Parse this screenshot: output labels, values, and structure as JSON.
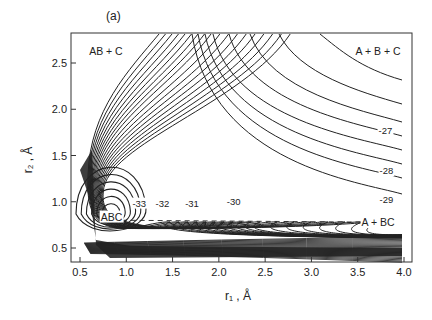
{
  "figure": {
    "panel_label": "(a)",
    "background": "#ffffff",
    "ink": "#222222"
  },
  "chart_data": {
    "type": "contour",
    "title": "",
    "panel_label": "(a)",
    "xlabel": "r₁ , Å",
    "ylabel": "r₂ , Å",
    "xlim": [
      0.4,
      4.05
    ],
    "ylim": [
      0.35,
      2.8
    ],
    "grid": false,
    "x_ticks": [
      0.5,
      1.0,
      1.5,
      2.0,
      2.5,
      3.0,
      3.5,
      4.0
    ],
    "x_tick_labels": [
      "0.5",
      "1.0",
      "1.5",
      "2.0",
      "2.5",
      "3.0",
      "3.5",
      "4.0"
    ],
    "y_ticks": [
      0.5,
      1.0,
      1.5,
      2.0,
      2.5
    ],
    "y_tick_labels": [
      "0.5",
      "1.0",
      "1.5",
      "2.0",
      "2.5"
    ],
    "region_labels": [
      {
        "text": "AB + C",
        "x": 0.78,
        "y": 2.63
      },
      {
        "text": "A + B + C",
        "x": 3.72,
        "y": 2.63
      },
      {
        "text": "ABC",
        "x": 0.84,
        "y": 0.84
      },
      {
        "text": "A + BC",
        "x": 3.72,
        "y": 0.78
      }
    ],
    "contour_labels": [
      {
        "text": "-33",
        "x": 1.14,
        "y": 0.98
      },
      {
        "text": "-32",
        "x": 1.39,
        "y": 0.98
      },
      {
        "text": "-31",
        "x": 1.71,
        "y": 0.98
      },
      {
        "text": "-30",
        "x": 2.16,
        "y": 1.0
      },
      {
        "text": "-29",
        "x": 3.81,
        "y": 1.02
      },
      {
        "text": "-28",
        "x": 3.81,
        "y": 1.33
      },
      {
        "text": "-27",
        "x": 3.8,
        "y": 1.76
      }
    ],
    "minimum": {
      "label": "ABC",
      "r1": 0.84,
      "r2": 0.84
    },
    "reaction_path": {
      "style": "dashed",
      "from": [
        0.95,
        0.8
      ],
      "to": [
        3.55,
        0.78
      ],
      "label": "A + BC"
    },
    "contour_levels_labeled": [
      -33,
      -32,
      -31,
      -30,
      -29,
      -28,
      -27
    ],
    "series": [
      {
        "name": "closed_well_contours",
        "count": 6
      },
      {
        "name": "open_contours_to_top",
        "count": 18
      },
      {
        "name": "contours_to_right_edge",
        "count": 8
      },
      {
        "name": "repulsive_wall",
        "description": "dense band near r2 ≈ 0.45–0.55 and r1 ≈ 0.5–0.6"
      }
    ]
  }
}
